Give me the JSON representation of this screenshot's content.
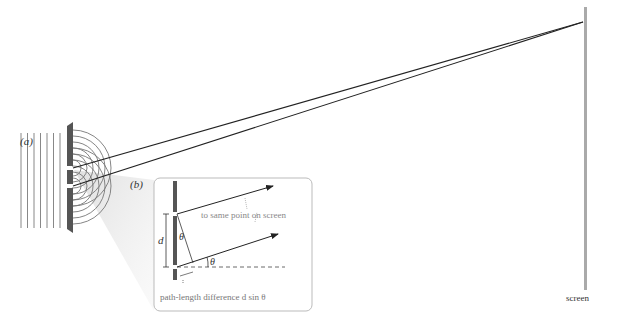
{
  "figure": {
    "panel_a_label": "(a)",
    "panel_b_label": "(b)",
    "screen_label": "screen",
    "inset": {
      "annotation_same_point": "to same point on screen",
      "annotation_path_difference": "path-length difference d sin θ",
      "d_label": "d",
      "theta_label_inner": "θ",
      "theta_label_angle": "θ"
    },
    "colors": {
      "barrier": "#555555",
      "screen": "#aaaaaa",
      "wave_lines": "#777777",
      "inset_border": "#bbbbbb",
      "inset_text": "#777777",
      "rays": "#222222"
    }
  }
}
